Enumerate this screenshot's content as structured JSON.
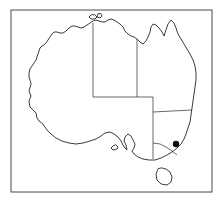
{
  "figure": {
    "width": 222,
    "height": 199,
    "background_color": "#ffffff"
  },
  "frame": {
    "name": "map-border-frame",
    "x": 11,
    "y": 10,
    "width": 201,
    "height": 182,
    "stroke_color": "#4a4a4a",
    "stroke_width": 1
  },
  "map": {
    "outline_color": "#1a1a1a",
    "outline_width": 0.85,
    "fill_color": "#ffffff",
    "mainland": {
      "name": "australia-mainland-outline",
      "path": "M 31 84 L 29 91 L 31 96 L 29 101 L 30 107 L 33 110 L 36 113 L 37 118 L 39 121 L 43 124 L 47 130 L 51 134 L 56 138 L 62 141 L 69 143 L 76 144 L 83 143 L 90 141 L 96 139 L 101 136 L 105 133 L 110 132 L 114 134 L 118 137 L 121 141 L 123 145 L 125 148 L 127 150 L 126 145 L 124 141 L 125 137 L 128 134 L 131 136 L 133 140 L 135 144 L 134 148 L 132 151 L 134 154 L 138 157 L 143 159 L 149 160 L 155 160 L 161 158 L 167 155 L 172 152 L 177 148 L 181 144 L 184 139 L 186 134 L 188 128 L 190 122 L 191 115 L 192 108 L 193 101 L 194 94 L 195 87 L 196 80 L 196 73 L 195 66 L 193 60 L 190 54 L 187 49 L 184 44 L 181 39 L 178 34 L 176 28 L 174 23 L 171 20 L 168 24 L 166 30 L 164 36 L 162 32 L 159 28 L 156 25 L 153 24 L 151 27 L 150 32 L 148 37 L 146 41 L 143 44 L 140 42 L 137 39 L 134 37 L 131 36 L 128 34 L 125 31 L 123 27 L 120 24 L 117 22 L 114 20 L 111 19 L 108 20 L 105 22 L 102 22 L 99 21 L 96 20 L 93 21 L 90 23 L 87 25 L 84 27 L 81 28 L 78 27 L 75 26 L 72 26 L 69 28 L 66 31 L 63 33 L 60 33 L 57 32 L 54 32 L 52 34 L 50 37 L 48 40 L 46 43 L 44 45 L 42 46 L 40 48 L 39 51 L 38 54 L 37 57 L 36 60 L 34 63 L 32 66 L 30 69 L 29 73 L 29 77 L 30 80 Z"
    },
    "tasmania": {
      "name": "tasmania-island-outline",
      "path": "M 158 169 L 156 174 L 157 180 L 161 184 L 167 185 L 171 182 L 172 177 L 170 172 L 166 169 L 162 168 Z"
    },
    "melville_island": {
      "name": "melville-island-outline",
      "path": "M 91 15 L 89 17 L 91 19 L 95 19 L 97 17 L 95 15 Z"
    },
    "small_island_north": {
      "name": "bathurst-island-outline",
      "path": "M 98 14 L 97 17 L 100 18 L 102 16 L 101 14 Z"
    },
    "kangaroo_island": {
      "name": "kangaroo-island-outline",
      "path": "M 113 146 L 111 148 L 113 150 L 117 149 L 118 147 L 116 145 Z"
    }
  },
  "state_borders": {
    "stroke_color": "#2a2a2a",
    "stroke_width": 0.7,
    "lines": [
      {
        "name": "wa-nt-sa-western-border",
        "label": "Western Australia eastern border",
        "path": "M 93 23 L 93 97"
      },
      {
        "name": "nt-qld-border",
        "label": "Northern Territory eastern border",
        "path": "M 137 39 L 137 97"
      },
      {
        "name": "sa-northern-border",
        "label": "South Australia northern border",
        "path": "M 93 97 L 153 97"
      },
      {
        "name": "sa-qld-nsw-eastern-border",
        "label": "South Australia eastern border",
        "path": "M 153 97 L 153 159"
      },
      {
        "name": "qld-nsw-border",
        "label": "Queensland / New South Wales border",
        "path": "M 153 112 L 192 110"
      },
      {
        "name": "nsw-vic-border",
        "label": "New South Wales / Victoria border",
        "path": "M 153 143 L 160 144 L 166 147 L 172 151 L 177 155"
      }
    ]
  },
  "marker": {
    "name": "location-marker-dot",
    "label": "Location marker",
    "x": 176,
    "y": 144,
    "radius": 3.2,
    "color": "#0a0a0a"
  }
}
